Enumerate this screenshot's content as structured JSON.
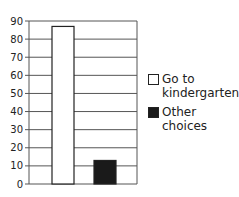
{
  "chart_data": {
    "type": "bar",
    "title": "",
    "xlabel": "",
    "ylabel": "",
    "categories": [
      "Go to kindergarten",
      "Other choices"
    ],
    "values": [
      87,
      13
    ],
    "colors": [
      "#ffffff",
      "#1a1a1a"
    ],
    "ylim": [
      0,
      90
    ],
    "yticks": [
      0,
      10,
      20,
      30,
      40,
      50,
      60,
      70,
      80,
      90
    ],
    "grid": true,
    "legend_position": "right"
  },
  "legend": [
    {
      "label": "Go to\nkindergarten",
      "color": "#ffffff"
    },
    {
      "label": "Other\nchoices",
      "color": "#1a1a1a"
    }
  ]
}
